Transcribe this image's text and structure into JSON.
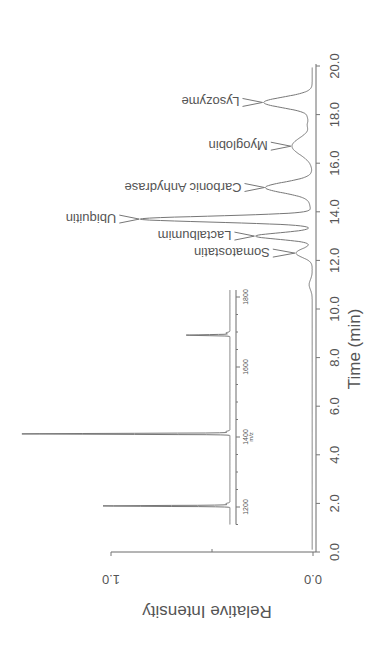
{
  "chart_data": [
    {
      "type": "line",
      "name": "chromatogram",
      "title": "",
      "xlabel": "Time (min)",
      "ylabel": "Relative Intensity",
      "xlim": [
        0.0,
        20.0
      ],
      "ylim": [
        0.0,
        1.0
      ],
      "x_ticks": [
        "0.0",
        "2.0",
        "4.0",
        "6.0",
        "8.0",
        "10.0",
        "12.0",
        "14.0",
        "16.0",
        "18.0",
        "20.0"
      ],
      "y_ticks": [
        "0.0",
        "1.0"
      ],
      "rotation": "figure rotated 180 degrees",
      "grid": false,
      "peaks": [
        {
          "label": "Somatostatin",
          "time": 12.3,
          "intensity": 0.08
        },
        {
          "label": "Lactalbumim",
          "time": 13.0,
          "intensity": 0.28
        },
        {
          "label": "Ubiquitin",
          "time": 13.7,
          "intensity": 0.85
        },
        {
          "label": "Carbonic Anhydrase",
          "time": 15.0,
          "intensity": 0.23
        },
        {
          "label": "Myoglobin",
          "time": 16.7,
          "intensity": 0.1
        },
        {
          "label": "Lysozyme",
          "time": 18.5,
          "intensity": 0.24
        }
      ]
    },
    {
      "type": "line",
      "name": "inset-mass-spectrum",
      "xlabel": "m/z",
      "xlim": [
        1150,
        1820
      ],
      "x_ticks": [
        "1200",
        "1400",
        "1600",
        "1800"
      ],
      "peaks": [
        {
          "mz": 1203,
          "intensity": 0.61
        },
        {
          "mz": 1409,
          "intensity": 1.0
        },
        {
          "mz": 1691,
          "intensity": 0.21
        }
      ]
    }
  ]
}
